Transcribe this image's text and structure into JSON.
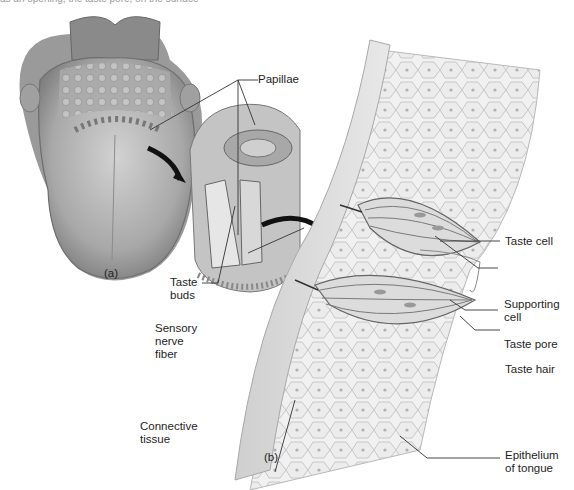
{
  "caption_fragment": "as an opening, the taste pore, on the surface",
  "panels": {
    "a": {
      "label": "(a)",
      "subject": "tongue"
    },
    "b": {
      "label": "(b)",
      "subject": "taste bud cross-section"
    }
  },
  "labels": {
    "papillae": "Papillae",
    "taste_buds": "Taste\nbuds",
    "sensory_nerve_fiber": "Sensory\nnerve\nfiber",
    "connective_tissue": "Connective\ntissue",
    "taste_cell": "Taste cell",
    "supporting_cell": "Supporting\ncell",
    "taste_pore": "Taste pore",
    "taste_hair": "Taste hair",
    "epithelium_of_tongue": "Epithelium\nof tongue"
  },
  "colors": {
    "tissue_light": "#e4e4e4",
    "tissue_mid": "#b8b8b8",
    "tissue_dark": "#7a7a7a",
    "arrow": "#111111",
    "leader_line": "#333333"
  }
}
